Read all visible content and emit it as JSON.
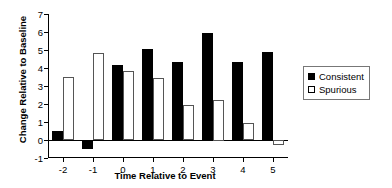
{
  "chart_data": {
    "type": "bar",
    "title": "",
    "xlabel": "Time Relative to Event",
    "ylabel": "Change Relative to Baseline",
    "categories": [
      "-2",
      "-1",
      "0",
      "1",
      "2",
      "3",
      "4",
      "5"
    ],
    "series": [
      {
        "name": "Consistent",
        "color": "#000000",
        "style": "filled",
        "values": [
          0.5,
          -0.5,
          4.15,
          5.05,
          4.35,
          5.95,
          4.35,
          4.9
        ]
      },
      {
        "name": "Spurious",
        "color": "#ffffff",
        "style": "open",
        "values": [
          3.5,
          4.85,
          3.85,
          3.45,
          1.95,
          2.25,
          0.95,
          -0.25
        ]
      }
    ],
    "ylim": [
      -1,
      7
    ],
    "yticks": [
      -1,
      0,
      1,
      2,
      3,
      4,
      5,
      6,
      7
    ],
    "ytick_labels": [
      "-1",
      "0",
      "1",
      "2",
      "3",
      "4",
      "5",
      "6",
      "7"
    ],
    "xticks": [
      "-2",
      "-1",
      "0",
      "1",
      "2",
      "3",
      "4",
      "5"
    ],
    "grid": false,
    "legend_position": "right"
  },
  "legend": {
    "entries": [
      {
        "label": "Consistent",
        "marker": "filled-square-icon"
      },
      {
        "label": "Spurious",
        "marker": "open-square-icon"
      }
    ]
  }
}
